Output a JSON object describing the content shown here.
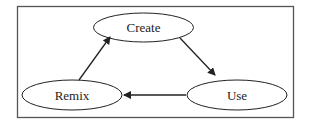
{
  "diagram": {
    "type": "cycle",
    "frame_color": "#555555",
    "line_color": "#222222",
    "nodes": [
      {
        "id": "create",
        "label": "Create"
      },
      {
        "id": "use",
        "label": "Use"
      },
      {
        "id": "remix",
        "label": "Remix"
      }
    ],
    "edges": [
      {
        "from": "Create",
        "to": "Use"
      },
      {
        "from": "Use",
        "to": "Remix"
      },
      {
        "from": "Remix",
        "to": "Create"
      }
    ]
  }
}
